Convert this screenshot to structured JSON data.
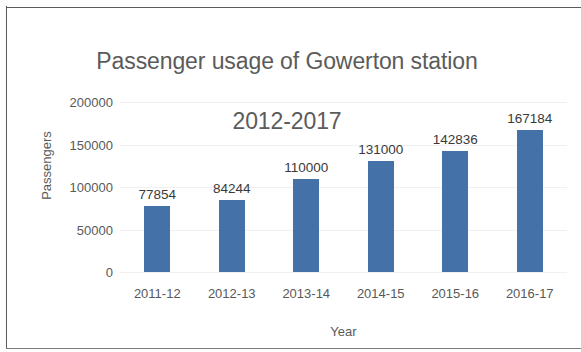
{
  "chart_data": {
    "type": "bar",
    "title": "Passenger usage of Gowerton station\n2012-2017",
    "title_line1": "Passenger usage of Gowerton station",
    "title_line2": "2012-2017",
    "xlabel": "Year",
    "ylabel": "Passengers",
    "categories": [
      "2011-12",
      "2012-13",
      "2013-14",
      "2014-15",
      "2015-16",
      "2016-17"
    ],
    "values": [
      77854,
      84244,
      110000,
      131000,
      142836,
      167184
    ],
    "value_labels": [
      "77854",
      "84244",
      "110000",
      "131000",
      "142836",
      "167184"
    ],
    "ylim": [
      0,
      200000
    ],
    "yticks": [
      0,
      50000,
      100000,
      150000,
      200000
    ],
    "ytick_labels": [
      "0",
      "50000",
      "100000",
      "150000",
      "200000"
    ],
    "grid": true,
    "legend": false,
    "bar_color": "#4472a8",
    "text_color": "#595959",
    "background": "#ffffff"
  }
}
